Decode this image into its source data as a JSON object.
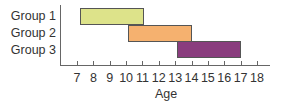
{
  "chart_data": {
    "type": "bar",
    "orientation": "horizontal-range",
    "title": "",
    "xlabel": "Age",
    "ylabel": "",
    "categories": [
      "Group 1",
      "Group 2",
      "Group 3"
    ],
    "ranges": [
      {
        "name": "Group 1",
        "start": 7.2,
        "end": 11.1,
        "color": "#dde38a"
      },
      {
        "name": "Group 2",
        "start": 10.1,
        "end": 14,
        "color": "#f5b16f"
      },
      {
        "name": "Group 3",
        "start": 13.1,
        "end": 17,
        "color": "#8a3d7e"
      }
    ],
    "xticks": [
      "7",
      "8",
      "9",
      "10",
      "11",
      "12",
      "13",
      "14",
      "15",
      "16",
      "17",
      "18"
    ],
    "xlim": [
      6.0,
      18.8
    ],
    "grid": false,
    "legend": null
  }
}
